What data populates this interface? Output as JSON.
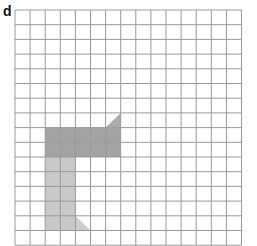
{
  "figure": {
    "label": "d",
    "grid": {
      "columns": 15,
      "rows": 16,
      "origin_x": 15,
      "origin_y": 10,
      "cell_w": 15.1,
      "cell_h": 14.7,
      "line_color": "#9a9a9a"
    },
    "shapes": [
      {
        "name": "dark-horizontal-bar",
        "type": "rect",
        "col": 2,
        "row": 8,
        "cols": 5,
        "rows": 2,
        "color": "#a3a3a3"
      },
      {
        "name": "top-right-triangle",
        "type": "triangle",
        "points_cells": [
          [
            6,
            8
          ],
          [
            7,
            8
          ],
          [
            7,
            7
          ]
        ],
        "color": "#acacac"
      },
      {
        "name": "light-vertical-bar",
        "type": "rect",
        "col": 2,
        "row": 10,
        "cols": 2,
        "rows": 5,
        "color": "#c9c9c9"
      },
      {
        "name": "bottom-triangle",
        "type": "triangle",
        "points_cells": [
          [
            4,
            14
          ],
          [
            4,
            15
          ],
          [
            5,
            15
          ]
        ],
        "color": "#cdcdcd"
      }
    ]
  }
}
